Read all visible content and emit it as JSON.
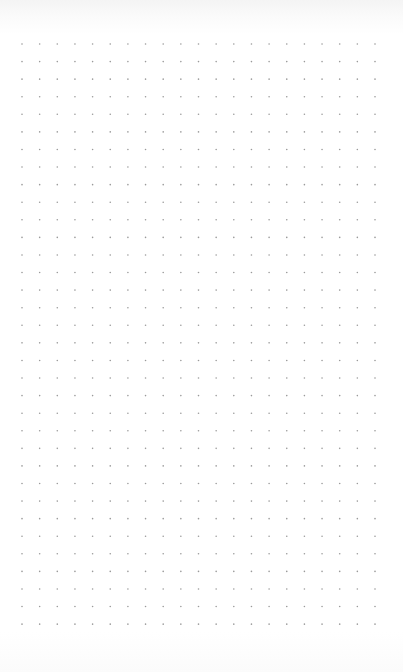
{
  "page": {
    "type": "dot-grid-notebook-page",
    "background_color": "#ffffff",
    "dot_color": "#9a9a9a"
  },
  "grid": {
    "columns": 21,
    "rows": 34,
    "origin_x": 22,
    "origin_y": 44,
    "spacing_x": 17.65,
    "spacing_y": 17.58,
    "dot_radius": 0.8
  }
}
